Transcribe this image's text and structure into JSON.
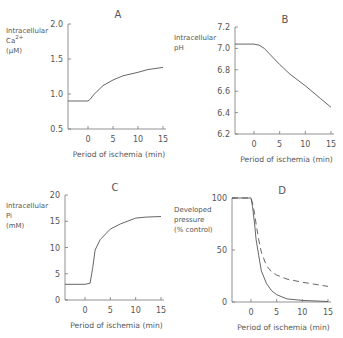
{
  "chart_data": [
    {
      "type": "line",
      "panel": "A",
      "title": "A",
      "ylabel": [
        "Intracellular",
        "Ca2+",
        "(µM)"
      ],
      "xlabel": "Period of ischemia (min)",
      "xticks": [
        "0",
        "5",
        "10",
        "15"
      ],
      "yticks": [
        "0.5",
        "1.0",
        "1.5",
        "2.0"
      ],
      "ylim": [
        0.5,
        2.0
      ],
      "xlim": [
        -4,
        15
      ],
      "series": [
        {
          "name": "Ca",
          "x": [
            -4,
            0,
            0.5,
            1,
            2,
            3,
            5,
            7,
            10,
            12,
            15
          ],
          "y": [
            0.9,
            0.9,
            0.93,
            0.98,
            1.05,
            1.12,
            1.2,
            1.26,
            1.31,
            1.35,
            1.38
          ],
          "style": "solid"
        }
      ]
    },
    {
      "type": "line",
      "panel": "B",
      "title": "B",
      "ylabel": [
        "Intracellular",
        "pH"
      ],
      "xlabel": "Period of ischemia (min)",
      "xticks": [
        "0",
        "5",
        "10",
        "15"
      ],
      "yticks": [
        "6.2",
        "6.4",
        "6.6",
        "6.8",
        "7.0",
        "7.2"
      ],
      "ylim": [
        6.2,
        7.2
      ],
      "xlim": [
        -4,
        15
      ],
      "series": [
        {
          "name": "pH",
          "x": [
            -4,
            0,
            1,
            2,
            3,
            5,
            7,
            10,
            13,
            15
          ],
          "y": [
            7.04,
            7.04,
            7.03,
            7.0,
            6.95,
            6.85,
            6.76,
            6.65,
            6.53,
            6.45
          ],
          "style": "solid"
        }
      ]
    },
    {
      "type": "line",
      "panel": "C",
      "title": "C",
      "ylabel": [
        "Intracellular",
        "Pi",
        "(mM)"
      ],
      "xlabel": "Period of ischemia (min)",
      "xticks": [
        "0",
        "5",
        "10",
        "15"
      ],
      "yticks": [
        "0",
        "5",
        "10",
        "15",
        "20"
      ],
      "ylim": [
        0,
        20
      ],
      "xlim": [
        -4,
        15
      ],
      "series": [
        {
          "name": "Pi",
          "x": [
            -4,
            0,
            1,
            1.5,
            2,
            3,
            5,
            7,
            10,
            12,
            15
          ],
          "y": [
            3,
            3,
            3.2,
            6,
            9.5,
            11.5,
            13.5,
            14.5,
            15.6,
            15.8,
            15.9
          ],
          "style": "solid"
        }
      ]
    },
    {
      "type": "line",
      "panel": "D",
      "title": "D",
      "ylabel": [
        "Developed",
        "pressure",
        "(% control)"
      ],
      "xlabel": "Period of ischemia (min)",
      "xticks": [
        "0",
        "5",
        "10",
        "15"
      ],
      "yticks": [
        "0",
        "50",
        "100"
      ],
      "ylim": [
        0,
        100
      ],
      "xlim": [
        -4,
        15
      ],
      "series": [
        {
          "name": "solid",
          "x": [
            -4,
            0,
            0.3,
            0.7,
            1,
            1.5,
            2,
            3,
            4,
            5,
            7,
            10,
            15
          ],
          "y": [
            100,
            100,
            92,
            75,
            60,
            45,
            30,
            18,
            11,
            7,
            3,
            1.5,
            0.5
          ],
          "style": "solid"
        },
        {
          "name": "dashed",
          "x": [
            -4,
            0,
            0.3,
            0.7,
            1,
            1.5,
            2,
            3,
            4,
            5,
            7,
            10,
            15
          ],
          "y": [
            100,
            100,
            95,
            85,
            75,
            60,
            48,
            35,
            29,
            26,
            22,
            19,
            15
          ],
          "style": "dashed"
        }
      ]
    }
  ]
}
